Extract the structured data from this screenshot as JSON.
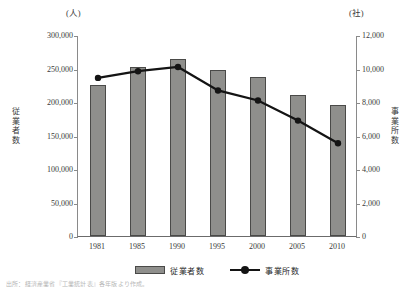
{
  "chart_data": {
    "type": "bar",
    "title": "",
    "categories": [
      "1981",
      "1985",
      "1990",
      "1995",
      "2000",
      "2005",
      "2010"
    ],
    "xlabel": "",
    "unit_left": "(人)",
    "unit_right": "(社)",
    "ylabel_left": "従業者数",
    "ylabel_right": "事業所数",
    "ylim_left": [
      0,
      300000
    ],
    "ylim_right": [
      0,
      12000
    ],
    "yticks_left": [
      "300,000",
      "250,000",
      "200,000",
      "150,000",
      "100,000",
      "50,000",
      "0"
    ],
    "yticks_right": [
      "12,000",
      "10,000",
      "8,000",
      "6,000",
      "4,000",
      "2,000",
      "0"
    ],
    "ytick_values_left": [
      300000,
      250000,
      200000,
      150000,
      100000,
      50000,
      0
    ],
    "ytick_values_right": [
      12000,
      10000,
      8000,
      6000,
      4000,
      2000,
      0
    ],
    "grid": false,
    "legend_position": "bottom",
    "series": [
      {
        "name": "従業者数",
        "type": "bar",
        "axis": "left",
        "color": "#8f8f8c",
        "values": [
          225000,
          252000,
          264000,
          248000,
          237000,
          211000,
          196000
        ]
      },
      {
        "name": "事業所数",
        "type": "line",
        "axis": "right",
        "color": "#141414",
        "values": [
          9500,
          9900,
          10150,
          8750,
          8150,
          6950,
          5600
        ]
      }
    ]
  },
  "legend": {
    "items": [
      {
        "label": "従業者数",
        "marker": "bar-swatch"
      },
      {
        "label": "事業所数",
        "marker": "line-dot"
      }
    ]
  },
  "source_note": "出所：経済産業省『工業統計表』各年版より作成。"
}
